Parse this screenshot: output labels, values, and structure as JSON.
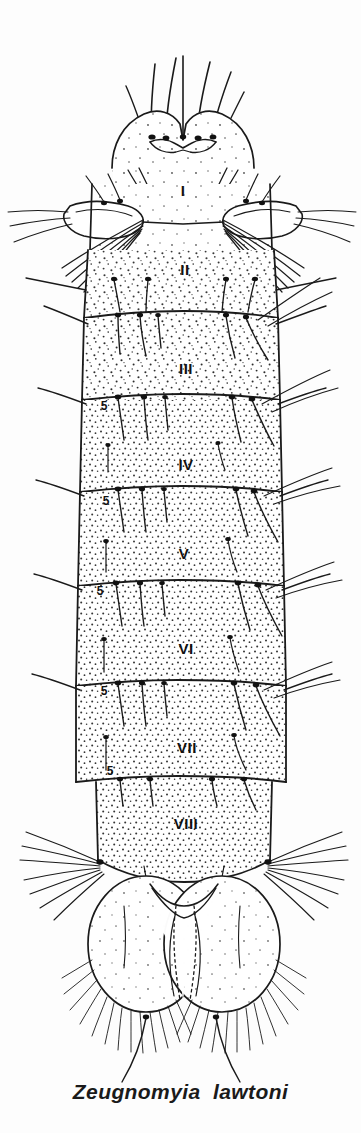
{
  "figure": {
    "caption": "Zeugnomyia  lawtoni",
    "ink_color": "#1a1a1a",
    "background_color": "#fdfdfd",
    "segment_labels": [
      {
        "text": "I",
        "x": 183,
        "y": 196,
        "size": 15
      },
      {
        "text": "II",
        "x": 185,
        "y": 275,
        "size": 15
      },
      {
        "text": "III",
        "x": 186,
        "y": 374,
        "size": 15
      },
      {
        "text": "IV",
        "x": 186,
        "y": 470,
        "size": 15
      },
      {
        "text": "V",
        "x": 184,
        "y": 559,
        "size": 15
      },
      {
        "text": "VI",
        "x": 186,
        "y": 654,
        "size": 15
      },
      {
        "text": "VII",
        "x": 187,
        "y": 753,
        "size": 15
      },
      {
        "text": "VIII",
        "x": 186,
        "y": 829,
        "size": 15
      }
    ],
    "seta_labels": [
      {
        "text": "5",
        "x": 104,
        "y": 410,
        "size": 12
      },
      {
        "text": "5",
        "x": 106,
        "y": 505,
        "size": 12
      },
      {
        "text": "5",
        "x": 100,
        "y": 595,
        "size": 12
      },
      {
        "text": "5",
        "x": 104,
        "y": 695,
        "size": 12
      },
      {
        "text": "5",
        "x": 110,
        "y": 775,
        "size": 12
      }
    ],
    "structures": {
      "thorax": "anterior two-lobed thoracic plate with long dorsal setae",
      "lateral_plates": "paired lateral plates with dense radiating seta tufts",
      "segments": "eight stippled abdominal segments with transverse intersegmental lines",
      "terminal": "paired large oval anal papillae / cercal lobes with fringed marginal hairs",
      "caudal_setae": "two long caudal filaments extending posteriorly"
    }
  }
}
